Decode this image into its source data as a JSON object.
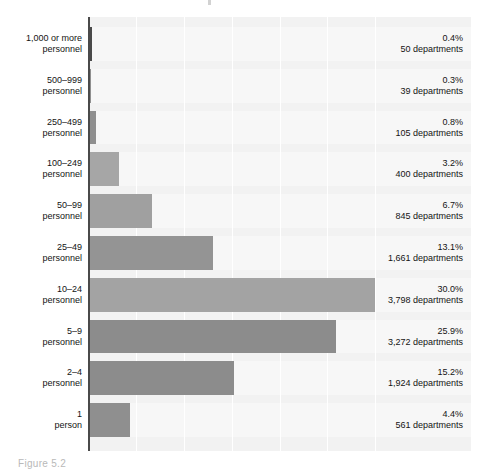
{
  "caption": "Figure 5.2",
  "colors": {
    "bar_light": "#a6a6a6",
    "bar_dark": "#8f8f8f",
    "bar_top": "#4a4a4a",
    "plot_background": "#f2f2f2",
    "row_band": "#f7f7f7",
    "gridline": "#ffffff",
    "axis_spine": "#4a4a4a",
    "text": "#141414"
  },
  "chart_data": {
    "type": "bar",
    "orientation": "horizontal",
    "title": "",
    "xlabel": "",
    "ylabel": "",
    "xlim": [
      0,
      40
    ],
    "grid": true,
    "gridlines_x": [
      5,
      10,
      15,
      20,
      25,
      30
    ],
    "legend": "none",
    "categories": [
      "1,000 or more personnel",
      "500–999 personnel",
      "250–499 personnel",
      "100–249 personnel",
      "50–99 personnel",
      "25–49 personnel",
      "10–24 personnel",
      "5–9 personnel",
      "2–4 personnel",
      "1 person"
    ],
    "values": [
      0.4,
      0.3,
      0.8,
      3.2,
      6.7,
      13.1,
      30.0,
      25.9,
      15.2,
      4.4
    ],
    "counts": [
      50,
      39,
      105,
      400,
      845,
      1661,
      3798,
      3272,
      561,
      0
    ],
    "rows": [
      {
        "label_line1": "1,000 or more",
        "label_line2": "personnel",
        "percent_text": "0.4%",
        "percent_value": 0.4,
        "count_text": "50 departments",
        "count_value": 50,
        "bar_color": "#4a4a4a"
      },
      {
        "label_line1": "500–999",
        "label_line2": "personnel",
        "percent_text": "0.3%",
        "percent_value": 0.3,
        "count_text": "39 departments",
        "count_value": 39,
        "bar_color": "#8f8f8f"
      },
      {
        "label_line1": "250–499",
        "label_line2": "personnel",
        "percent_text": "0.8%",
        "percent_value": 0.8,
        "count_text": "105 departments",
        "count_value": 105,
        "bar_color": "#8f8f8f"
      },
      {
        "label_line1": "100–249",
        "label_line2": "personnel",
        "percent_text": "3.2%",
        "percent_value": 3.2,
        "count_text": "400 departments",
        "count_value": 400,
        "bar_color": "#a6a6a6"
      },
      {
        "label_line1": "50–99",
        "label_line2": "personnel",
        "percent_text": "6.7%",
        "percent_value": 6.7,
        "count_text": "845 departments",
        "count_value": 845,
        "bar_color": "#a0a0a0"
      },
      {
        "label_line1": "25–49",
        "label_line2": "personnel",
        "percent_text": "13.1%",
        "percent_value": 13.1,
        "count_text": "1,661 departments",
        "count_value": 1661,
        "bar_color": "#949494"
      },
      {
        "label_line1": "10–24",
        "label_line2": "personnel",
        "percent_text": "30.0%",
        "percent_value": 30.0,
        "count_text": "3,798 departments",
        "count_value": 3798,
        "bar_color": "#a3a3a3"
      },
      {
        "label_line1": "5–9",
        "label_line2": "personnel",
        "percent_text": "25.9%",
        "percent_value": 25.9,
        "count_text": "3,272 departments",
        "count_value": 3272,
        "bar_color": "#8c8c8c"
      },
      {
        "label_line1": "2–4",
        "label_line2": "personnel",
        "percent_text": "15.2%",
        "percent_value": 15.2,
        "count_text": "1,924 departments",
        "count_value": 1924,
        "bar_color": "#8c8c8c"
      },
      {
        "label_line1": "1",
        "label_line2": "person",
        "percent_text": "4.4%",
        "percent_value": 4.4,
        "count_text": "561 departments",
        "count_value": 561,
        "bar_color": "#8f8f8f"
      }
    ]
  }
}
